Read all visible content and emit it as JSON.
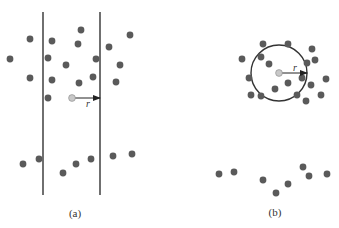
{
  "panel_a": {
    "label": "(a)",
    "radius_label": "r",
    "boundary_lines_x": [
      43,
      100
    ],
    "boundary_y": [
      12,
      195
    ],
    "test_particle": {
      "x": 72,
      "y": 98
    },
    "arrow_end": {
      "x": 100,
      "y": 98
    },
    "particles": [
      [
        30,
        39
      ],
      [
        52,
        41
      ],
      [
        81,
        30
      ],
      [
        78,
        44
      ],
      [
        10,
        59
      ],
      [
        48,
        58
      ],
      [
        66,
        65
      ],
      [
        96,
        59
      ],
      [
        30,
        78
      ],
      [
        52,
        80
      ],
      [
        79,
        83
      ],
      [
        93,
        77
      ],
      [
        48,
        98
      ],
      [
        109,
        47
      ],
      [
        130,
        35
      ],
      [
        120,
        65
      ],
      [
        116,
        82
      ],
      [
        23,
        164
      ],
      [
        39,
        159
      ],
      [
        63,
        173
      ],
      [
        76,
        164
      ],
      [
        91,
        159
      ],
      [
        113,
        156
      ],
      [
        132,
        154
      ]
    ]
  },
  "panel_b": {
    "label": "(b)",
    "radius_label": "r",
    "circle": {
      "cx": 279,
      "cy": 73,
      "r": 28
    },
    "test_particle": {
      "x": 279,
      "y": 73
    },
    "arrow_end": {
      "x": 307,
      "y": 73
    },
    "particles": [
      [
        263,
        44
      ],
      [
        288,
        44
      ],
      [
        312,
        49
      ],
      [
        242,
        59
      ],
      [
        261,
        57
      ],
      [
        269,
        64
      ],
      [
        307,
        63
      ],
      [
        315,
        60
      ],
      [
        249,
        78
      ],
      [
        288,
        83
      ],
      [
        302,
        78
      ],
      [
        311,
        85
      ],
      [
        326,
        79
      ],
      [
        275,
        89
      ],
      [
        251,
        95
      ],
      [
        261,
        96
      ],
      [
        297,
        95
      ],
      [
        306,
        101
      ],
      [
        321,
        95
      ],
      [
        219,
        174
      ],
      [
        234,
        172
      ],
      [
        263,
        180
      ],
      [
        276,
        193
      ],
      [
        288,
        184
      ],
      [
        303,
        167
      ],
      [
        309,
        176
      ],
      [
        327,
        174
      ]
    ]
  },
  "colors": {
    "particle": "#5a5a5a",
    "test_particle": "#c8c8c8",
    "line": "#333333"
  }
}
